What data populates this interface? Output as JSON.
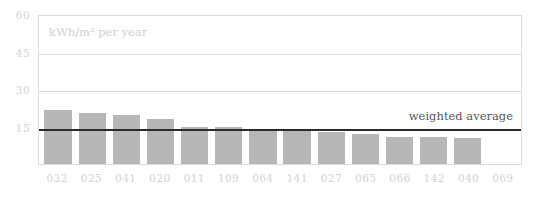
{
  "chart_data": {
    "type": "bar",
    "title": "",
    "subtitle": "",
    "unit_caption": "kWh/m² per year",
    "xlabel": "",
    "ylabel": "",
    "ylim": [
      0,
      60
    ],
    "grid": true,
    "legend": "none",
    "y_ticks": [
      60,
      45,
      30,
      15
    ],
    "categories": [
      "032",
      "025",
      "041",
      "020",
      "011",
      "109",
      "064",
      "141",
      "027",
      "065",
      "066",
      "142",
      "040",
      "069"
    ],
    "values": [
      21.5,
      20.5,
      19.5,
      18.0,
      15.0,
      15.0,
      14.0,
      13.5,
      13.0,
      12.0,
      11.0,
      11.0,
      10.5,
      0
    ],
    "series": [
      {
        "name": "energy-use",
        "color": "#b7b7b7",
        "values": [
          21.5,
          20.5,
          19.5,
          18.0,
          15.0,
          15.0,
          14.0,
          13.5,
          13.0,
          12.0,
          11.0,
          11.0,
          10.5,
          0
        ]
      }
    ],
    "annotations": [
      {
        "name": "weighted-average",
        "label": "weighted average",
        "value": 14.7,
        "color": "#2b2b2b"
      }
    ],
    "colors": {
      "bar": "#b7b7b7",
      "grid": "#dcdcdc",
      "axis_text": "#d2d2d2",
      "annotation_text": "#575757",
      "average_line": "#2b2b2b",
      "caption": "#cfcfcf",
      "background": "#ffffff"
    }
  }
}
